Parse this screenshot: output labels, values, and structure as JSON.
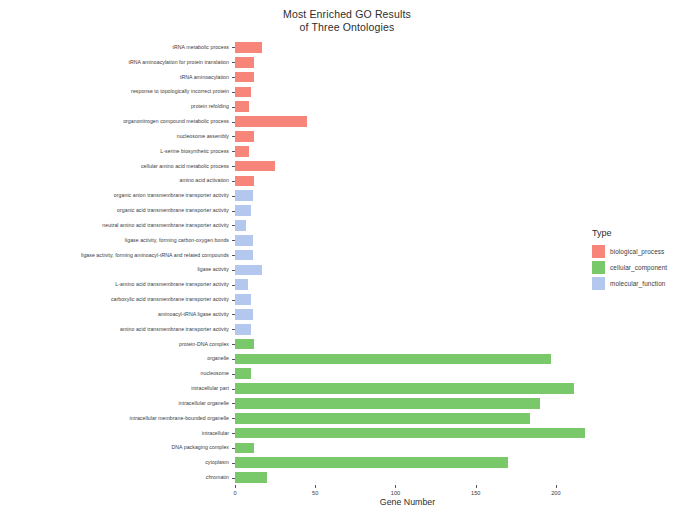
{
  "chart_data": {
    "type": "bar",
    "orientation": "horizontal",
    "title": "Most Enriched GO Results\nof Three Ontologies",
    "xlabel": "Gene Number",
    "ylabel": "GO Term",
    "xlim": [
      0,
      215
    ],
    "xticks": [
      0,
      50,
      100,
      150,
      200
    ],
    "xtick_labels": [
      "0",
      "50",
      "100",
      "150",
      "200"
    ],
    "grid": false,
    "legend_position": "right",
    "legend_title": "Type",
    "series": [
      {
        "name": "biological_process",
        "color": "#F8857A",
        "categories": [
          "tRNA metabolic process",
          "tRNA aminoacylation for protein translation",
          "tRNA aminoacylation",
          "response to topologically incorrect protein",
          "protein refolding",
          "organonitrogen compound metabolic process",
          "nucleosome assembly",
          "L-serine biosynthetic process",
          "cellular amino acid metabolic process",
          "amino acid activation"
        ],
        "values": [
          17,
          12,
          12,
          10,
          9,
          45,
          12,
          9,
          25,
          12
        ]
      },
      {
        "name": "molecular_function",
        "color": "#B4C7EE",
        "categories": [
          "organic anion transmembrane transporter activity",
          "organic acid transmembrane transporter activity",
          "neutral amino acid transmembrane transporter activity",
          "ligase activity, forming carbon-oxygen bonds",
          "ligase activity, forming aminoacyl-tRNA and related compounds",
          "ligase activity",
          "L-amino acid transmembrane transporter activity",
          "carboxylic acid transmembrane transporter activity",
          "aminoacyl-tRNA ligase activity",
          "amino acid transmembrane transporter activity"
        ],
        "values": [
          11,
          10,
          7,
          11,
          11,
          17,
          8,
          10,
          11,
          10
        ]
      },
      {
        "name": "cellular_component",
        "color": "#79C96B",
        "categories": [
          "protein-DNA complex",
          "organelle",
          "nucleosome",
          "intracellular part",
          "intracellular organelle",
          "intracellular membrane-bounded organelle",
          "intracellular",
          "DNA packaging complex",
          "cytoplasm",
          "chromatin"
        ],
        "values": [
          12,
          197,
          10,
          211,
          190,
          184,
          218,
          12,
          170,
          20
        ]
      }
    ],
    "y_categories_top_to_bottom": [
      {
        "label": "tRNA metabolic process",
        "value": 17,
        "type": "biological_process"
      },
      {
        "label": "tRNA aminoacylation for protein translation",
        "value": 12,
        "type": "biological_process"
      },
      {
        "label": "tRNA aminoacylation",
        "value": 12,
        "type": "biological_process"
      },
      {
        "label": "response to topologically incorrect protein",
        "value": 10,
        "type": "biological_process"
      },
      {
        "label": "protein refolding",
        "value": 9,
        "type": "biological_process"
      },
      {
        "label": "organonitrogen compound metabolic process",
        "value": 45,
        "type": "biological_process"
      },
      {
        "label": "nucleosome assembly",
        "value": 12,
        "type": "biological_process"
      },
      {
        "label": "L-serine biosynthetic process",
        "value": 9,
        "type": "biological_process"
      },
      {
        "label": "cellular amino acid metabolic process",
        "value": 25,
        "type": "biological_process"
      },
      {
        "label": "amino acid activation",
        "value": 12,
        "type": "biological_process"
      },
      {
        "label": "organic anion transmembrane transporter activity",
        "value": 11,
        "type": "molecular_function"
      },
      {
        "label": "organic acid transmembrane transporter activity",
        "value": 10,
        "type": "molecular_function"
      },
      {
        "label": "neutral amino acid transmembrane transporter activity",
        "value": 7,
        "type": "molecular_function"
      },
      {
        "label": "ligase activity, forming carbon-oxygen bonds",
        "value": 11,
        "type": "molecular_function"
      },
      {
        "label": "ligase activity, forming aminoacyl-tRNA and related compounds",
        "value": 11,
        "type": "molecular_function"
      },
      {
        "label": "ligase activity",
        "value": 17,
        "type": "molecular_function"
      },
      {
        "label": "L-amino acid transmembrane transporter activity",
        "value": 8,
        "type": "molecular_function"
      },
      {
        "label": "carboxylic acid transmembrane transporter activity",
        "value": 10,
        "type": "molecular_function"
      },
      {
        "label": "aminoacyl-tRNA ligase activity",
        "value": 11,
        "type": "molecular_function"
      },
      {
        "label": "amino acid transmembrane transporter activity",
        "value": 10,
        "type": "molecular_function"
      },
      {
        "label": "protein-DNA complex",
        "value": 12,
        "type": "cellular_component"
      },
      {
        "label": "organelle",
        "value": 197,
        "type": "cellular_component"
      },
      {
        "label": "nucleosome",
        "value": 10,
        "type": "cellular_component"
      },
      {
        "label": "intracellular part",
        "value": 211,
        "type": "cellular_component"
      },
      {
        "label": "intracellular organelle",
        "value": 190,
        "type": "cellular_component"
      },
      {
        "label": "intracellular membrane-bounded organelle",
        "value": 184,
        "type": "cellular_component"
      },
      {
        "label": "intracellular",
        "value": 218,
        "type": "cellular_component"
      },
      {
        "label": "DNA packaging complex",
        "value": 12,
        "type": "cellular_component"
      },
      {
        "label": "cytoplasm",
        "value": 170,
        "type": "cellular_component"
      },
      {
        "label": "chromatin",
        "value": 20,
        "type": "cellular_component"
      }
    ],
    "legend_entries": [
      {
        "label": "biological_process",
        "color": "#F8857A"
      },
      {
        "label": "cellular_component",
        "color": "#79C96B"
      },
      {
        "label": "molecular_function",
        "color": "#B4C7EE"
      }
    ]
  }
}
